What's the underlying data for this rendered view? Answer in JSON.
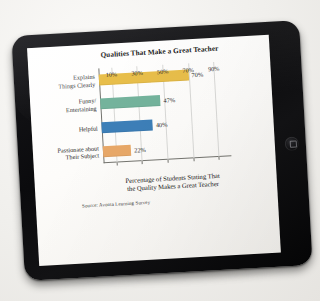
{
  "device": {
    "name": "tablet",
    "home_button": "home-button"
  },
  "chart_data": {
    "type": "bar",
    "orientation": "horizontal",
    "title": "Qualities That Make a Great Teacher",
    "categories": [
      "Explains Things Clearly",
      "Funny/ Entertaining",
      "Helpful",
      "Passionate about Their Subject"
    ],
    "values": [
      70,
      47,
      40,
      22
    ],
    "value_labels": [
      "70%",
      "47%",
      "40%",
      "22%"
    ],
    "colors": [
      "#E8BE4A",
      "#74B39C",
      "#3D7FB8",
      "#E8A868"
    ],
    "xlabel": "Percentage of Students Stating That the Quality Makes a Great Teacher",
    "xlabel_line1": "Percentage of Students Stating That",
    "xlabel_line2": "the Quality Makes a Great Teacher",
    "ylabel": "",
    "xlim": [
      0,
      100
    ],
    "xticks": [
      10,
      30,
      50,
      70,
      90
    ],
    "xtick_labels": [
      "10%",
      "30%",
      "50%",
      "70%",
      "90%"
    ],
    "grid": true,
    "legend": "none",
    "source": "Source: Avonta Learning Survey"
  },
  "category_lines": [
    [
      "Explains",
      "Things Clearly"
    ],
    [
      "Funny/",
      "Entertaining"
    ],
    [
      "Helpful",
      ""
    ],
    [
      "Passionate about",
      "Their Subject"
    ]
  ]
}
